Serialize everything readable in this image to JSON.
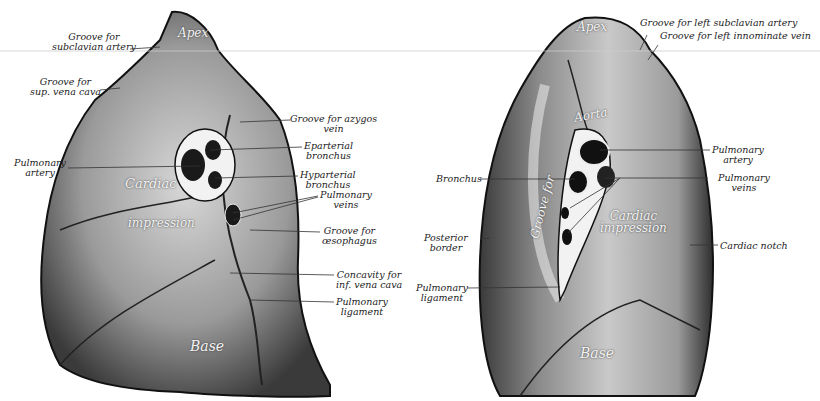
{
  "figure": {
    "right_lung_labels": {
      "groove_subclavian_artery": "Groove for\nsubclavian artery",
      "groove_sup_vena_cava": "Groove for\nsup. vena cava",
      "pulmonary_artery": "Pulmonary\nartery",
      "groove_azygos_vein": "Groove for azygos\nvein",
      "eparterial_bronchus": "Eparterial\nbronchus",
      "hyparterial_bronchus": "Hyparterial\nbronchus",
      "pulmonary_veins": "Pulmonary\nveins",
      "groove_oesophagus": "Groove for\nœsophagus",
      "concavity_inf_vena_cava": "Concavity for\ninf. vena cava",
      "pulmonary_ligament": "Pulmonary\nligament"
    },
    "right_lung_inner": {
      "apex": "Apex",
      "cardiac": "Cardiac",
      "impression": "impression",
      "base": "Base"
    },
    "left_lung_labels": {
      "groove_left_subclavian": "Groove for left subclavian artery",
      "groove_left_innominate": "Groove for left innominate vein",
      "pulmonary_artery": "Pulmonary\nartery",
      "pulmonary_veins": "Pulmonary\nveins",
      "cardiac_notch": "Cardiac notch",
      "bronchus": "Bronchus",
      "posterior_border": "Posterior\nborder",
      "pulmonary_ligament": "Pulmonary\nligament"
    },
    "left_lung_inner": {
      "apex": "Apex",
      "aorta": "Aorta",
      "groove_for": "Groove for",
      "cardiac_impression": "Cardiac\nimpression",
      "base": "Base"
    }
  }
}
